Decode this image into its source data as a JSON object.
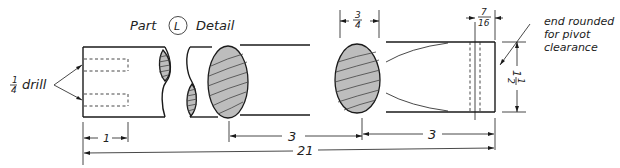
{
  "title": {
    "prefix": "Part",
    "part_letter": "L",
    "suffix": "Detail"
  },
  "notes": {
    "drill": {
      "fraction_num": "1",
      "fraction_den": "4",
      "text": "drill"
    },
    "end_note": {
      "line1": "end rounded",
      "line2": "for pivot",
      "line3": "clearance"
    }
  },
  "dimensions": {
    "hole_depth": "1",
    "section_spacing_1": "3",
    "section_spacing_2": "3",
    "overall_length": "21",
    "section_width": {
      "num": "3",
      "den": "4"
    },
    "pivot_offset": {
      "num": "7",
      "den": "16"
    },
    "height": {
      "whole": "1",
      "num": "1",
      "den": "2"
    }
  },
  "colors": {
    "line": "#1a1a1a",
    "section_fill": "#bdbdbd",
    "background": "#ffffff"
  }
}
